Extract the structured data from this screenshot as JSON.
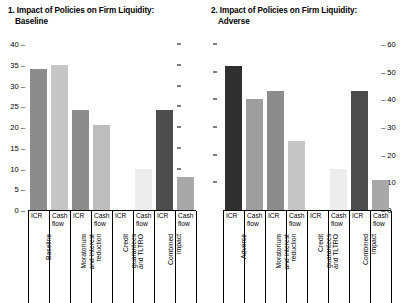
{
  "panels": [
    {
      "title_line1": "1. Impact of Policies on Firm Liquidity:",
      "title_line2": "Baseline",
      "axis_side": "left",
      "chart": {
        "type": "bar",
        "title": "1. Impact of Policies on Firm Liquidity: Baseline",
        "xlabel": "",
        "ylabel": "",
        "ylim": [
          0,
          40
        ],
        "yticks": [
          0,
          5,
          10,
          15,
          20,
          25,
          30,
          35,
          40
        ],
        "grid": false,
        "legend": "none",
        "groups": [
          "Baseline",
          "Moratorium and interest reduction",
          "Credit guarantees and TLTRO",
          "Combined impact"
        ],
        "categories": [
          "ICR",
          "Cash flow",
          "ICR",
          "Cash flow",
          "ICR",
          "Cash flow",
          "ICR",
          "Cash flow"
        ],
        "values": [
          34,
          35,
          24,
          20.5,
          0,
          10,
          24,
          8
        ],
        "colors": [
          "#8c8c8c",
          "#c6c6c6",
          "#8c8c8c",
          "#bdbdbd",
          "#8c8c8c",
          "#ededed",
          "#4d4d4d",
          "#a8a8a8"
        ]
      }
    },
    {
      "title_line1": "2. Impact of Policies on Firm Liquidity:",
      "title_line2": "Adverse",
      "axis_side": "right",
      "chart": {
        "type": "bar",
        "title": "2. Impact of Policies on Firm Liquidity: Adverse",
        "xlabel": "",
        "ylabel": "",
        "ylim": [
          0,
          60
        ],
        "yticks": [
          0,
          10,
          20,
          30,
          40,
          50,
          60
        ],
        "grid": false,
        "legend": "none",
        "groups": [
          "Adverse",
          "Moratorium and interest reduction",
          "Credit guarantees and TLTRO",
          "Combined impact"
        ],
        "categories": [
          "ICR",
          "Cash flow",
          "ICR",
          "Cash flow",
          "ICR",
          "Cash flow",
          "ICR",
          "Cash flow"
        ],
        "values": [
          52,
          40,
          43,
          25,
          0,
          15,
          43,
          11
        ],
        "colors": [
          "#303030",
          "#9e9e9e",
          "#8c8c8c",
          "#c6c6c6",
          "#8c8c8c",
          "#ededed",
          "#4d4d4d",
          "#a8a8a8"
        ]
      }
    }
  ],
  "chart_data": [
    {
      "type": "bar",
      "title": "1. Impact of Policies on Firm Liquidity: Baseline",
      "xlabel": "",
      "ylabel": "",
      "ylim": [
        0,
        40
      ],
      "yticks": [
        0,
        5,
        10,
        15,
        20,
        25,
        30,
        35,
        40
      ],
      "grid": false,
      "legend": "none",
      "groups": [
        "Baseline",
        "Moratorium and interest reduction",
        "Credit guarantees and TLTRO",
        "Combined impact"
      ],
      "categories": [
        "ICR",
        "Cash flow",
        "ICR",
        "Cash flow",
        "ICR",
        "Cash flow",
        "ICR",
        "Cash flow"
      ],
      "values": [
        34,
        35,
        24,
        20.5,
        0,
        10,
        24,
        8
      ]
    },
    {
      "type": "bar",
      "title": "2. Impact of Policies on Firm Liquidity: Adverse",
      "xlabel": "",
      "ylabel": "",
      "ylim": [
        0,
        60
      ],
      "yticks": [
        0,
        10,
        20,
        30,
        40,
        50,
        60
      ],
      "grid": false,
      "legend": "none",
      "groups": [
        "Adverse",
        "Moratorium and interest reduction",
        "Credit guarantees and TLTRO",
        "Combined impact"
      ],
      "categories": [
        "ICR",
        "Cash flow",
        "ICR",
        "Cash flow",
        "ICR",
        "Cash flow",
        "ICR",
        "Cash flow"
      ],
      "values": [
        52,
        40,
        43,
        25,
        0,
        15,
        43,
        11
      ]
    }
  ]
}
